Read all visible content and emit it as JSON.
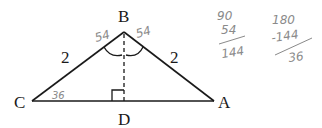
{
  "diagram": {
    "type": "isosceles triangle with altitude",
    "vertices": {
      "B": {
        "label": "B"
      },
      "C": {
        "label": "C"
      },
      "A": {
        "label": "A"
      },
      "D": {
        "label": "D"
      }
    },
    "side_labels": {
      "BC": "2",
      "BA": "2"
    },
    "angle_annotations": {
      "B_left": "54",
      "B_right": "54",
      "C": "36"
    },
    "right_angle_at": "D",
    "altitude": "BD (dashed)"
  },
  "handwritten_work": {
    "sum": {
      "line1": "90",
      "line2": "54",
      "result": "144"
    },
    "difference": {
      "line1": "180",
      "line2": "-144",
      "result": "36"
    }
  },
  "colors": {
    "ink": "#1a1a1a",
    "pencil": "#8a8a8a"
  }
}
